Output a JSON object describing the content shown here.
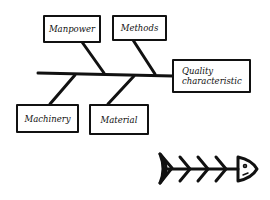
{
  "diagram": {
    "type": "fishbone (Ishikawa) cause-and-effect diagram",
    "effect": {
      "label_line1": "Quality",
      "label_line2": "characteristic"
    },
    "causes": [
      {
        "label": "Manpower",
        "position": "top"
      },
      {
        "label": "Methods",
        "position": "top"
      },
      {
        "label": "Machinery",
        "position": "bottom"
      },
      {
        "label": "Material",
        "position": "bottom"
      }
    ],
    "icon": "fish-skeleton-icon",
    "colors": {
      "ink": "#111111",
      "background": "#ffffff"
    }
  }
}
